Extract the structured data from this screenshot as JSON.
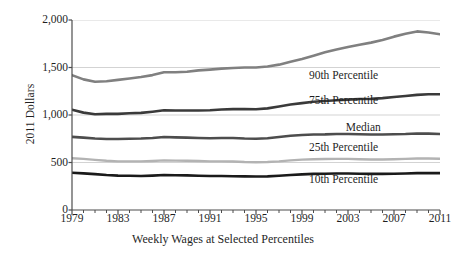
{
  "chart_data": {
    "type": "line",
    "title": "",
    "xlabel": "Weekly Wages at Selected Percentiles",
    "ylabel": "2011 Dollars",
    "xlim": [
      1979,
      2011
    ],
    "ylim": [
      0,
      2000
    ],
    "grid": true,
    "legend_position": "inline-right",
    "x_tick_labels": [
      "1979",
      "1983",
      "1987",
      "1991",
      "1995",
      "1999",
      "2003",
      "2007",
      "2011"
    ],
    "x_tick_values": [
      1979,
      1983,
      1987,
      1991,
      1995,
      1999,
      2003,
      2007,
      2011
    ],
    "x_minor_tick_step": 1,
    "y_tick_labels": [
      "0",
      "500",
      "1,000",
      "1,500",
      "2,000"
    ],
    "y_tick_values": [
      0,
      500,
      1000,
      1500,
      2000
    ],
    "x": [
      1979,
      1980,
      1981,
      1982,
      1983,
      1984,
      1985,
      1986,
      1987,
      1988,
      1989,
      1990,
      1991,
      1992,
      1993,
      1994,
      1995,
      1996,
      1997,
      1998,
      1999,
      2000,
      2001,
      2002,
      2003,
      2004,
      2005,
      2006,
      2007,
      2008,
      2009,
      2010,
      2011
    ],
    "series": [
      {
        "name": "90th Percentile",
        "color": "#808080",
        "width": 2.6,
        "label_x": 1999.6,
        "label_y": 1395,
        "values": [
          1420,
          1375,
          1350,
          1355,
          1370,
          1385,
          1400,
          1420,
          1450,
          1450,
          1455,
          1470,
          1478,
          1488,
          1495,
          1500,
          1500,
          1510,
          1530,
          1560,
          1590,
          1625,
          1660,
          1690,
          1715,
          1740,
          1762,
          1790,
          1825,
          1855,
          1880,
          1868,
          1850
        ]
      },
      {
        "name": "75th Percentile",
        "color": "#3a3a3a",
        "width": 2.6,
        "label_x": 1999.6,
        "label_y": 1140,
        "values": [
          1055,
          1025,
          1008,
          1012,
          1012,
          1018,
          1022,
          1035,
          1050,
          1048,
          1048,
          1048,
          1050,
          1058,
          1062,
          1062,
          1060,
          1070,
          1090,
          1110,
          1125,
          1140,
          1148,
          1155,
          1162,
          1168,
          1170,
          1178,
          1190,
          1200,
          1212,
          1218,
          1218
        ]
      },
      {
        "name": "Median",
        "color": "#4d4d4d",
        "width": 2.6,
        "label_x": 2002.8,
        "label_y": 852,
        "values": [
          770,
          762,
          752,
          748,
          748,
          750,
          752,
          758,
          768,
          765,
          762,
          758,
          755,
          758,
          758,
          752,
          750,
          755,
          768,
          782,
          790,
          795,
          796,
          800,
          800,
          798,
          795,
          795,
          798,
          800,
          806,
          804,
          800
        ]
      },
      {
        "name": "25th Percentile",
        "color": "#b3b3b3",
        "width": 2.4,
        "label_x": 1999.6,
        "label_y": 642,
        "values": [
          545,
          538,
          528,
          518,
          512,
          512,
          512,
          516,
          522,
          520,
          518,
          515,
          512,
          512,
          510,
          505,
          503,
          505,
          512,
          522,
          530,
          535,
          537,
          538,
          538,
          535,
          532,
          532,
          535,
          538,
          542,
          542,
          540
        ]
      },
      {
        "name": "10th Percentile",
        "color": "#1a1a1a",
        "width": 2.6,
        "label_x": 1999.6,
        "label_y": 305,
        "values": [
          392,
          386,
          378,
          368,
          362,
          360,
          358,
          362,
          368,
          366,
          364,
          360,
          358,
          358,
          356,
          354,
          352,
          354,
          360,
          368,
          375,
          380,
          382,
          384,
          384,
          382,
          380,
          380,
          382,
          384,
          388,
          390,
          388
        ]
      }
    ]
  }
}
